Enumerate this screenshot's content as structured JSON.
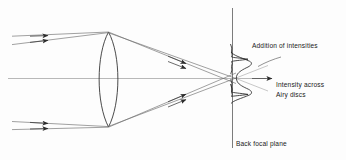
{
  "figure": {
    "background_color": "#fdfdfd",
    "ink_color": "#2b2b2b",
    "axis_color": "#9a9a9a",
    "labels": {
      "addition_of_intensities": "Addition of intensities",
      "intensity_across_line1": "Intensity across",
      "intensity_across_line2": "Airy  discs",
      "back_focal_plane": "Back focal plane"
    },
    "elements": {
      "lens_name": "biconvex-lens",
      "optical_axis_name": "optical-axis",
      "focal_plane_name": "back-focal-plane-line",
      "incoming_ray_count": 4,
      "converging_ray_count": 4,
      "airy_peak_count": 2
    }
  }
}
